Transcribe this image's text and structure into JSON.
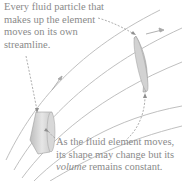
{
  "captions": {
    "top": {
      "line1": "Every fluid particle that",
      "line2": "makes up the element",
      "line3": "moves on its own",
      "line4": "streamline."
    },
    "bottom": {
      "line1": "As the fluid element moves,",
      "line2": "its shape may change but its",
      "line3_italic": "volume",
      "line3_rest": " remains constant."
    }
  },
  "diagram": {
    "elements": [
      "streamlines",
      "fluid-element-start",
      "fluid-element-end",
      "velocity-arrows",
      "dashed-leader-lines"
    ],
    "colors": {
      "streamline": "#b5b5b5",
      "element_fill": "#cfcfcf",
      "text": "#8a8a8a",
      "leader": "#9a9a9a"
    }
  }
}
